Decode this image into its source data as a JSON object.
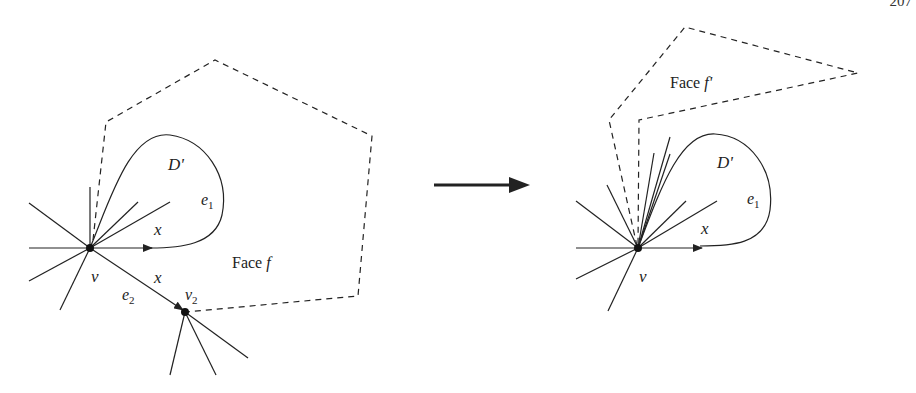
{
  "page_number": "207",
  "left_panel": {
    "vertex_v": "v",
    "vertex_v2": "v",
    "vertex_v2_sub": "2",
    "region_label": "D'",
    "edge_e1": "e",
    "edge_e1_sub": "1",
    "edge_e2": "e",
    "edge_e2_sub": "2",
    "x_label_top": "x",
    "x_label_bottom": "x",
    "face_label": "Face ",
    "face_var": "f"
  },
  "transform_arrow": "right-arrow",
  "right_panel": {
    "vertex_v": "v",
    "region_label": "D'",
    "edge_e1": "e",
    "edge_e1_sub": "1",
    "x_label": "x",
    "face_label": "Face ",
    "face_var": "f'"
  },
  "colors": {
    "stroke": "#222222",
    "background": "#ffffff"
  }
}
